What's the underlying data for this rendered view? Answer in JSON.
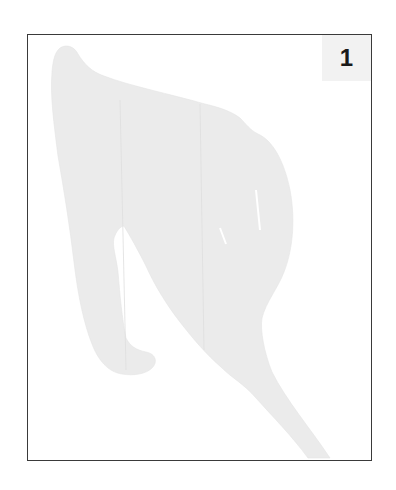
{
  "figure": {
    "label": "1",
    "shape_fill": "#ebebeb",
    "frame_color": "#3a3a3a",
    "label_box_color": "#f2f2f2"
  }
}
